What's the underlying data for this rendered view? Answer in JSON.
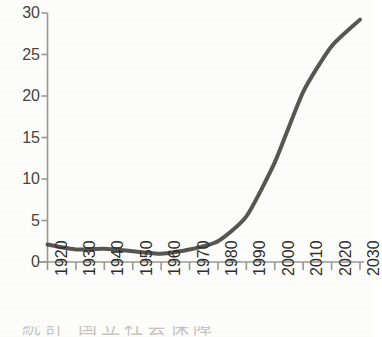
{
  "chart_data": {
    "type": "line",
    "title": "",
    "subtitle": "",
    "xlabel": "",
    "ylabel": "",
    "x": [
      1920,
      1930,
      1940,
      1950,
      1960,
      1970,
      1980,
      1990,
      2000,
      2010,
      2020,
      2030
    ],
    "categories": [
      "1920",
      "1930",
      "1940",
      "1950",
      "1960",
      "1970",
      "1980",
      "1990",
      "2000",
      "2010",
      "2020",
      "2030"
    ],
    "series": [
      {
        "name": "",
        "values": [
          2.1,
          1.5,
          1.6,
          1.3,
          1.0,
          1.5,
          2.5,
          5.5,
          12.0,
          20.5,
          26.0,
          29.2
        ]
      }
    ],
    "values": [
      2.1,
      1.5,
      1.6,
      1.3,
      1.0,
      1.5,
      2.5,
      5.5,
      12.0,
      20.5,
      26.0,
      29.2
    ],
    "xlim": [
      1920,
      2030
    ],
    "ylim": [
      0,
      30
    ],
    "y_ticks": [
      0,
      5,
      10,
      15,
      20,
      25,
      30
    ],
    "y_tick_labels": [
      "0",
      "5",
      "10",
      "15",
      "20",
      "25",
      "30"
    ],
    "x_ticks": [
      1920,
      1930,
      1940,
      1950,
      1960,
      1970,
      1980,
      1990,
      2000,
      2010,
      2020,
      2030
    ],
    "x_tick_labels": [
      "1920",
      "1930",
      "1940",
      "1950",
      "1960",
      "1970",
      "1980",
      "1990",
      "2000",
      "2010",
      "2020",
      "2030"
    ],
    "x_tick_label_rotation": -90,
    "grid": false,
    "legend": false,
    "legend_position": "none",
    "line_color": "#4a4842",
    "line_width": 4,
    "markers": false,
    "axis_color": "#9a9890",
    "background_color": "#fdfdfb"
  },
  "axes": {
    "y_ticks": [
      {
        "label": "30",
        "value": 30
      },
      {
        "label": "25",
        "value": 25
      },
      {
        "label": "20",
        "value": 20
      },
      {
        "label": "15",
        "value": 15
      },
      {
        "label": "10",
        "value": 10
      },
      {
        "label": "5",
        "value": 5
      },
      {
        "label": "0",
        "value": 0
      }
    ],
    "x_ticks": [
      {
        "label": "1920",
        "value": 1920
      },
      {
        "label": "1930",
        "value": 1930
      },
      {
        "label": "1940",
        "value": 1940
      },
      {
        "label": "1950",
        "value": 1950
      },
      {
        "label": "1960",
        "value": 1960
      },
      {
        "label": "1970",
        "value": 1970
      },
      {
        "label": "1980",
        "value": 1980
      },
      {
        "label": "1990",
        "value": 1990
      },
      {
        "label": "2000",
        "value": 2000
      },
      {
        "label": "2010",
        "value": 2010
      },
      {
        "label": "2020",
        "value": 2020
      },
      {
        "label": "2030",
        "value": 2030
      }
    ]
  },
  "caption": {
    "clipped_text": "統計 国立社会保障"
  }
}
